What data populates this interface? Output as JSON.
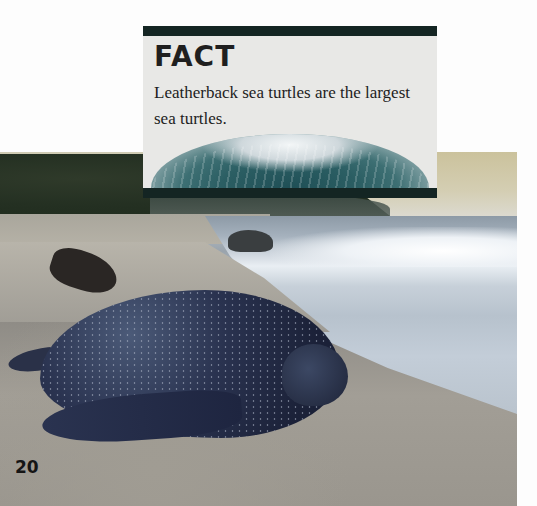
{
  "page": {
    "number": "20",
    "background_color": "#fdfdfd"
  },
  "fact_box": {
    "title": "FACT",
    "text": "Leatherback sea turtles are the largest sea turtles.",
    "bar_color": "#142523",
    "background_color": "#e8e8e6",
    "image": "ocean-wave"
  },
  "photo": {
    "subject": "leatherback-sea-turtle-on-beach",
    "elements": [
      "jungle",
      "headland",
      "surf",
      "sand",
      "driftwood",
      "turtle"
    ]
  }
}
